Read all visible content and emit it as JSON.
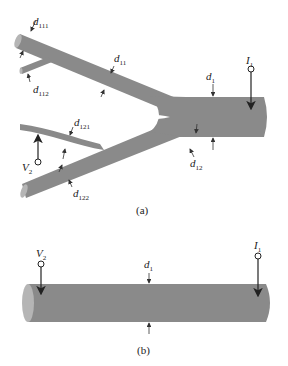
{
  "figure_a": {
    "caption": "(a)",
    "labels": {
      "d1": {
        "main": "d",
        "sub": "1"
      },
      "d11": {
        "main": "d",
        "sub": "11"
      },
      "d12": {
        "main": "d",
        "sub": "12"
      },
      "d111": {
        "main": "d",
        "sub": "111"
      },
      "d112": {
        "main": "d",
        "sub": "112"
      },
      "d121": {
        "main": "d",
        "sub": "121"
      },
      "d122": {
        "main": "d",
        "sub": "122"
      },
      "I1": {
        "main": "I",
        "sub": "1"
      },
      "V2": {
        "main": "V",
        "sub": "2"
      }
    }
  },
  "figure_b": {
    "caption": "(b)",
    "labels": {
      "d1": {
        "main": "d",
        "sub": "1"
      },
      "I1": {
        "main": "I",
        "sub": "1"
      },
      "V2": {
        "main": "V",
        "sub": "2"
      }
    }
  },
  "colors": {
    "cable_fill": "#8a8a8a",
    "cable_end": "#b5b5b5",
    "stroke": "#333333"
  }
}
